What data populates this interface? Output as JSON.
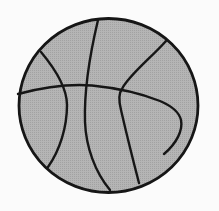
{
  "illustration": {
    "name": "basketball clipart",
    "background_color": "#fbfbfb",
    "ball_fill_color": "#b5b5b5",
    "ball_texture_dot_color": "#a2a2a2",
    "line_color": "#161616",
    "shapes": {
      "outline": "M 19,105.5 A 89.5,87 0 1 0 198,105.5 A 89.5,87 0 1 0 19,105.5 Z",
      "vertical_seam": "M 98,20 C 89,58 84,92 85,122 C 86,147 95,172 110,190",
      "horizontal_seam": "M 18,94 C 48,86 72,84 92,85.5 C 112,87.5 140,93 160,101 C 172,106 179,112 181,120 C 183,130 177,143 164,154",
      "right_seam": "M 166,41 C 152,57 128,76 122,89 C 118,94 119,102 121,110 C 127,136 133,160 139,183",
      "left_seam": "M 41,52 C 56,70 67,88 67,105 C 67,127 60,150 48,167"
    }
  }
}
